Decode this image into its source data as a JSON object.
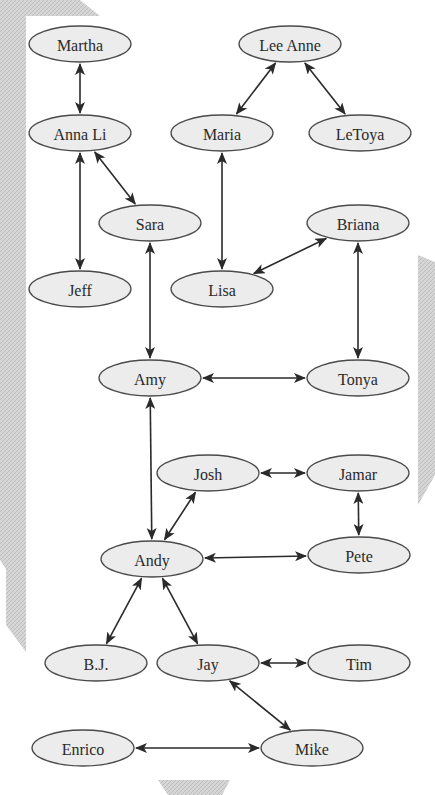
{
  "diagram": {
    "type": "social-network-graph",
    "node_fill": "#ececec",
    "node_stroke": "#4a4a4a",
    "edge_color": "#2a2a2a",
    "background_hatch_color": "#c8c8c8",
    "nodes": [
      {
        "id": "martha",
        "label": "Martha",
        "x": 80,
        "y": 44
      },
      {
        "id": "lee-anne",
        "label": "Lee Anne",
        "x": 290,
        "y": 44
      },
      {
        "id": "anna-li",
        "label": "Anna Li",
        "x": 80,
        "y": 133
      },
      {
        "id": "maria",
        "label": "Maria",
        "x": 222,
        "y": 133
      },
      {
        "id": "letoya",
        "label": "LeToya",
        "x": 360,
        "y": 133
      },
      {
        "id": "sara",
        "label": "Sara",
        "x": 150,
        "y": 223
      },
      {
        "id": "briana",
        "label": "Briana",
        "x": 358,
        "y": 223
      },
      {
        "id": "jeff",
        "label": "Jeff",
        "x": 80,
        "y": 289
      },
      {
        "id": "lisa",
        "label": "Lisa",
        "x": 222,
        "y": 289
      },
      {
        "id": "amy",
        "label": "Amy",
        "x": 150,
        "y": 378
      },
      {
        "id": "tonya",
        "label": "Tonya",
        "x": 358,
        "y": 378
      },
      {
        "id": "josh",
        "label": "Josh",
        "x": 208,
        "y": 473
      },
      {
        "id": "jamar",
        "label": "Jamar",
        "x": 358,
        "y": 473
      },
      {
        "id": "andy",
        "label": "Andy",
        "x": 152,
        "y": 559
      },
      {
        "id": "pete",
        "label": "Pete",
        "x": 359,
        "y": 555
      },
      {
        "id": "bj",
        "label": "B.J.",
        "x": 96,
        "y": 663
      },
      {
        "id": "jay",
        "label": "Jay",
        "x": 208,
        "y": 663
      },
      {
        "id": "tim",
        "label": "Tim",
        "x": 359,
        "y": 663
      },
      {
        "id": "enrico",
        "label": "Enrico",
        "x": 83,
        "y": 748
      },
      {
        "id": "mike",
        "label": "Mike",
        "x": 312,
        "y": 748
      }
    ],
    "edges": [
      {
        "from": "martha",
        "to": "anna-li",
        "bidirectional": true
      },
      {
        "from": "lee-anne",
        "to": "maria",
        "bidirectional": true
      },
      {
        "from": "lee-anne",
        "to": "letoya",
        "bidirectional": true
      },
      {
        "from": "anna-li",
        "to": "sara",
        "bidirectional": true
      },
      {
        "from": "anna-li",
        "to": "jeff",
        "bidirectional": true
      },
      {
        "from": "maria",
        "to": "lisa",
        "bidirectional": true
      },
      {
        "from": "lisa",
        "to": "briana",
        "bidirectional": true
      },
      {
        "from": "briana",
        "to": "tonya",
        "bidirectional": true
      },
      {
        "from": "sara",
        "to": "amy",
        "bidirectional": true
      },
      {
        "from": "amy",
        "to": "tonya",
        "bidirectional": true
      },
      {
        "from": "amy",
        "to": "andy",
        "bidirectional": true
      },
      {
        "from": "josh",
        "to": "jamar",
        "bidirectional": true
      },
      {
        "from": "josh",
        "to": "andy",
        "bidirectional": true
      },
      {
        "from": "jamar",
        "to": "pete",
        "bidirectional": true
      },
      {
        "from": "andy",
        "to": "pete",
        "bidirectional": true
      },
      {
        "from": "andy",
        "to": "bj",
        "bidirectional": true
      },
      {
        "from": "andy",
        "to": "jay",
        "bidirectional": true
      },
      {
        "from": "jay",
        "to": "tim",
        "bidirectional": true
      },
      {
        "from": "jay",
        "to": "mike",
        "bidirectional": true
      },
      {
        "from": "enrico",
        "to": "mike",
        "bidirectional": true
      }
    ]
  }
}
